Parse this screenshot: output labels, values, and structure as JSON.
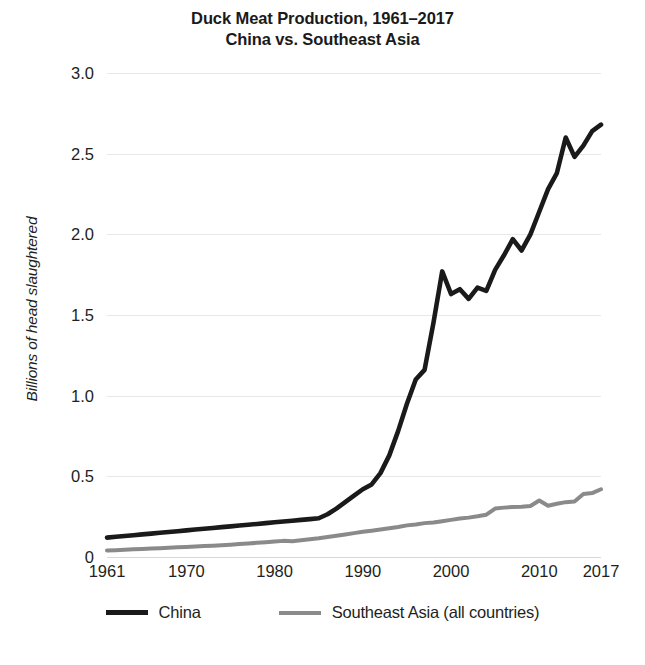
{
  "chart_data": {
    "type": "line",
    "title": "Duck Meat Production, 1961–2017",
    "subtitle": "China vs. Southeast Asia",
    "xlabel": "",
    "ylabel": "Billions of head slaughtered",
    "xlim": [
      1961,
      2017
    ],
    "ylim": [
      0,
      3.0
    ],
    "grid": true,
    "legend_position": "bottom",
    "y_ticks": [
      "0",
      "0.5",
      "1.0",
      "1.5",
      "2.0",
      "2.5",
      "3.0"
    ],
    "y_tick_values": [
      0,
      0.5,
      1.0,
      1.5,
      2.0,
      2.5,
      3.0
    ],
    "x_ticks": [
      "1961",
      "1970",
      "1980",
      "1990",
      "2000",
      "2010",
      "2017"
    ],
    "x_tick_values": [
      1961,
      1970,
      1980,
      1990,
      2000,
      2010,
      2017
    ],
    "x": [
      1961,
      1962,
      1963,
      1964,
      1965,
      1966,
      1967,
      1968,
      1969,
      1970,
      1971,
      1972,
      1973,
      1974,
      1975,
      1976,
      1977,
      1978,
      1979,
      1980,
      1981,
      1982,
      1983,
      1984,
      1985,
      1986,
      1987,
      1988,
      1989,
      1990,
      1991,
      1992,
      1993,
      1994,
      1995,
      1996,
      1997,
      1998,
      1999,
      2000,
      2001,
      2002,
      2003,
      2004,
      2005,
      2006,
      2007,
      2008,
      2009,
      2010,
      2011,
      2012,
      2013,
      2014,
      2015,
      2016,
      2017
    ],
    "series": [
      {
        "name": "China",
        "color": "#1a1a1a",
        "values": [
          0.12,
          0.125,
          0.13,
          0.135,
          0.14,
          0.145,
          0.15,
          0.155,
          0.16,
          0.165,
          0.17,
          0.175,
          0.18,
          0.185,
          0.19,
          0.195,
          0.2,
          0.205,
          0.21,
          0.215,
          0.22,
          0.225,
          0.23,
          0.235,
          0.24,
          0.265,
          0.3,
          0.34,
          0.38,
          0.42,
          0.45,
          0.52,
          0.63,
          0.78,
          0.95,
          1.1,
          1.16,
          1.45,
          1.77,
          1.63,
          1.66,
          1.6,
          1.67,
          1.65,
          1.78,
          1.87,
          1.97,
          1.9,
          2.0,
          2.14,
          2.28,
          2.38,
          2.6,
          2.48,
          2.55,
          2.64,
          2.68
        ]
      },
      {
        "name": "Southeast Asia (all countries)",
        "color": "#8a8a8a",
        "values": [
          0.04,
          0.042,
          0.045,
          0.048,
          0.05,
          0.052,
          0.055,
          0.058,
          0.06,
          0.062,
          0.065,
          0.068,
          0.07,
          0.073,
          0.076,
          0.08,
          0.084,
          0.088,
          0.092,
          0.096,
          0.1,
          0.098,
          0.104,
          0.11,
          0.116,
          0.124,
          0.132,
          0.14,
          0.148,
          0.156,
          0.163,
          0.17,
          0.178,
          0.186,
          0.196,
          0.202,
          0.21,
          0.214,
          0.222,
          0.23,
          0.238,
          0.244,
          0.252,
          0.262,
          0.3,
          0.306,
          0.31,
          0.312,
          0.316,
          0.35,
          0.318,
          0.33,
          0.34,
          0.344,
          0.39,
          0.396,
          0.42
        ]
      }
    ]
  },
  "legend": {
    "items": [
      {
        "label": "China",
        "color": "#1a1a1a"
      },
      {
        "label": "Southeast Asia (all countries)",
        "color": "#8a8a8a"
      }
    ]
  }
}
